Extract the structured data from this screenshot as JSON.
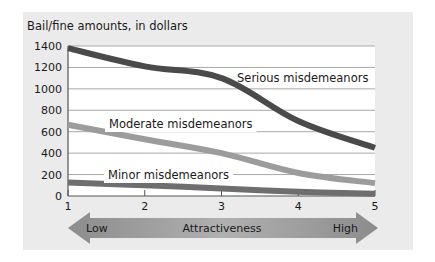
{
  "chart_data": {
    "type": "line",
    "title": "",
    "ylabel": "Bail/fine amounts, in dollars",
    "xlabel": "Attractiveness",
    "x": [
      1,
      2,
      3,
      4,
      5
    ],
    "x_tick_labels": [
      "1",
      "2",
      "3",
      "4",
      "5"
    ],
    "y_ticks": [
      0,
      200,
      400,
      600,
      800,
      1000,
      1200,
      1400
    ],
    "y_tick_labels": [
      "0",
      "200",
      "400",
      "600",
      "800",
      "1000",
      "1200",
      "1400"
    ],
    "ylim": [
      0,
      1400
    ],
    "xlim": [
      1,
      5
    ],
    "grid": true,
    "legend_position": "inline labels",
    "series": [
      {
        "name": "Serious misdemeanors",
        "values": [
          1380,
          1210,
          1100,
          700,
          450
        ],
        "color": "#4a4a4a"
      },
      {
        "name": "Moderate misdemeanors",
        "values": [
          665,
          530,
          400,
          215,
          120
        ],
        "color": "#9c9c9c"
      },
      {
        "name": "Minor misdemeanors",
        "values": [
          125,
          100,
          70,
          40,
          20
        ],
        "color": "#6e6e6e"
      }
    ],
    "series_labels": [
      {
        "text": "Serious misdemeanors",
        "x": 237,
        "y": 82,
        "bg": false
      },
      {
        "text": "Moderate misdemeanors",
        "x": 109,
        "y": 128,
        "bg": true
      },
      {
        "text": "Minor misdemeanors",
        "x": 108,
        "y": 179,
        "bg": true
      }
    ],
    "axis_arrow": {
      "left_label": "Low",
      "center_label": "Attractiveness",
      "right_label": "High"
    }
  },
  "colors": {
    "panel_bg": "#ebebeb",
    "plot_bg": "#ffffff",
    "grid": "#a8a8a8",
    "arrow_dark": "#8c8c8c",
    "arrow_light": "#b0b0b0"
  }
}
